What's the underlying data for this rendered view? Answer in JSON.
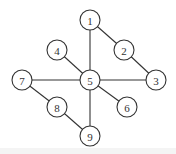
{
  "graph": {
    "node_radius": 10,
    "nodes": [
      {
        "id": "1",
        "label": "1",
        "x": 90,
        "y": 20
      },
      {
        "id": "2",
        "label": "2",
        "x": 124,
        "y": 50
      },
      {
        "id": "3",
        "label": "3",
        "x": 156,
        "y": 80
      },
      {
        "id": "4",
        "label": "4",
        "x": 57,
        "y": 50
      },
      {
        "id": "5",
        "label": "5",
        "x": 90,
        "y": 80
      },
      {
        "id": "6",
        "label": "6",
        "x": 127,
        "y": 107
      },
      {
        "id": "7",
        "label": "7",
        "x": 22,
        "y": 80
      },
      {
        "id": "8",
        "label": "8",
        "x": 57,
        "y": 107
      },
      {
        "id": "9",
        "label": "9",
        "x": 90,
        "y": 136
      }
    ],
    "edges": [
      [
        "1",
        "5"
      ],
      [
        "1",
        "2"
      ],
      [
        "2",
        "3"
      ],
      [
        "4",
        "5"
      ],
      [
        "7",
        "5"
      ],
      [
        "5",
        "3"
      ],
      [
        "5",
        "6"
      ],
      [
        "5",
        "9"
      ],
      [
        "7",
        "8"
      ],
      [
        "8",
        "9"
      ]
    ]
  }
}
